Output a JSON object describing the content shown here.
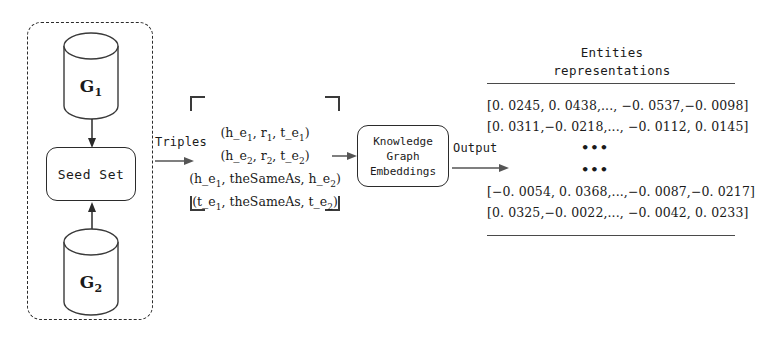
{
  "diagram": {
    "stroke_color": "#2b2b2b",
    "background_color": "#ffffff"
  },
  "input_group": {
    "name": "dashed-input-group",
    "graphs": [
      {
        "id": "g1",
        "label": "G",
        "subscript": "1"
      },
      {
        "id": "g2",
        "label": "G",
        "subscript": "2"
      }
    ],
    "seed_set": {
      "label": "Seed Set"
    }
  },
  "flow": {
    "triples_label": "Triples",
    "output_label": "Output"
  },
  "triples": {
    "lines": [
      {
        "text": "(h_e",
        "sub1": "1",
        "mid": ", r",
        "sub2": "1",
        "mid2": ", t_e",
        "sub3": "1",
        "end": ")"
      },
      {
        "text": "(h_e",
        "sub1": "2",
        "mid": ", r",
        "sub2": "2",
        "mid2": ", t_e",
        "sub3": "2",
        "end": ")"
      },
      {
        "text": "(h_e",
        "sub1": "1",
        "mid": ", theSameAs, h_e",
        "sub2": "2",
        "end": ")"
      },
      {
        "text": "(t_e",
        "sub1": "1",
        "mid": ", theSameAs, t_e",
        "sub2": "2",
        "end": ")"
      }
    ],
    "plain": [
      "(h_e1, r1, t_e1)",
      "(h_e2, r2, t_e2)",
      "(h_e1, theSameAs, h_e2)",
      "(t_e1, theSameAs, t_e2)"
    ]
  },
  "model": {
    "line1": "Knowledge",
    "line2": "Graph",
    "line3": "Embeddings"
  },
  "entities": {
    "header_line1": "Entities",
    "header_line2": "representations",
    "rows_top": [
      "[0. 0245, 0. 0438,..., −0. 0537,−0. 0098]",
      "[0. 0311,−0. 0218,..., −0. 0112, 0. 0145]"
    ],
    "ellipsis": [
      "•••",
      "•••"
    ],
    "rows_bottom": [
      "[−0. 0054, 0. 0368,...,−0. 0087,−0. 0217]",
      "[0. 0325,−0. 0022,..., −0. 0042, 0. 0233]"
    ]
  }
}
